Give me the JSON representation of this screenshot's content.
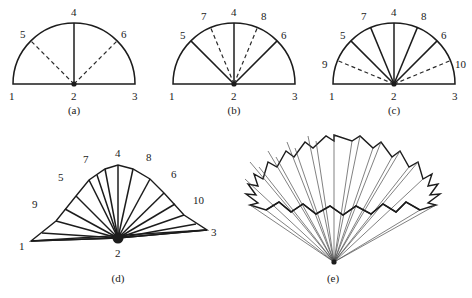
{
  "figure": {
    "background_color": "#ffffff",
    "line_color": "#1c1c1c",
    "thin_line_color": "#4a4a4a"
  },
  "panels": [
    {
      "id": "a",
      "caption": "(a)",
      "caption_pos": {
        "x": 74,
        "y": 111
      },
      "center": {
        "x": 74,
        "y": 84
      },
      "radius": 61,
      "solid_radii_deg": [
        90
      ],
      "dashed_radii_deg": [
        135,
        45
      ],
      "vertex_labels": [
        {
          "text": "1",
          "x": 9,
          "y": 96
        },
        {
          "text": "2",
          "x": 71,
          "y": 96
        },
        {
          "text": "3",
          "x": 132,
          "y": 96
        },
        {
          "text": "4",
          "x": 71,
          "y": 13
        },
        {
          "text": "5",
          "x": 22,
          "y": 35
        },
        {
          "text": "6",
          "x": 121,
          "y": 35
        }
      ]
    },
    {
      "id": "b",
      "caption": "(b)",
      "caption_pos": {
        "x": 234,
        "y": 111
      },
      "center": {
        "x": 234,
        "y": 84
      },
      "radius": 61,
      "solid_radii_deg": [
        90,
        135,
        45
      ],
      "dashed_radii_deg": [
        112.5,
        67.5
      ],
      "vertex_labels": [
        {
          "text": "1",
          "x": 169,
          "y": 96
        },
        {
          "text": "2",
          "x": 231,
          "y": 96
        },
        {
          "text": "3",
          "x": 292,
          "y": 96
        },
        {
          "text": "4",
          "x": 231,
          "y": 13
        },
        {
          "text": "5",
          "x": 182,
          "y": 36
        },
        {
          "text": "6",
          "x": 281,
          "y": 36
        },
        {
          "text": "7",
          "x": 203,
          "y": 17
        },
        {
          "text": "8",
          "x": 261,
          "y": 17
        }
      ]
    },
    {
      "id": "c",
      "caption": "(c)",
      "caption_pos": {
        "x": 394,
        "y": 111
      },
      "center": {
        "x": 394,
        "y": 84
      },
      "radius": 61,
      "solid_radii_deg": [
        90,
        135,
        45,
        112.5,
        67.5
      ],
      "dashed_radii_deg": [
        157.5,
        22.5
      ],
      "vertex_labels": [
        {
          "text": "1",
          "x": 329,
          "y": 96
        },
        {
          "text": "2",
          "x": 391,
          "y": 96
        },
        {
          "text": "3",
          "x": 452,
          "y": 96
        },
        {
          "text": "4",
          "x": 391,
          "y": 13
        },
        {
          "text": "5",
          "x": 342,
          "y": 36
        },
        {
          "text": "6",
          "x": 441,
          "y": 36
        },
        {
          "text": "7",
          "x": 363,
          "y": 17
        },
        {
          "text": "8",
          "x": 421,
          "y": 17
        },
        {
          "text": "9",
          "x": 325,
          "y": 65
        },
        {
          "text": "10",
          "x": 455,
          "y": 65
        }
      ]
    },
    {
      "id": "d",
      "caption": "(d)",
      "caption_pos": {
        "x": 118,
        "y": 278
      },
      "center": {
        "x": 118,
        "y": 238
      },
      "vertex_labels": [
        {
          "text": "1",
          "x": 23,
          "y": 246
        },
        {
          "text": "2",
          "x": 115,
          "y": 254
        },
        {
          "text": "3",
          "x": 210,
          "y": 234
        },
        {
          "text": "4",
          "x": 116,
          "y": 153
        },
        {
          "text": "5",
          "x": 58,
          "y": 177
        },
        {
          "text": "6",
          "x": 172,
          "y": 174
        },
        {
          "text": "7",
          "x": 85,
          "y": 159
        },
        {
          "text": "8",
          "x": 147,
          "y": 157
        },
        {
          "text": "9",
          "x": 34,
          "y": 204
        },
        {
          "text": "10",
          "x": 196,
          "y": 200
        }
      ]
    },
    {
      "id": "e",
      "caption": "(e)",
      "caption_pos": {
        "x": 333,
        "y": 278
      },
      "apex": {
        "x": 334,
        "y": 262
      },
      "vertex_labels": []
    }
  ]
}
